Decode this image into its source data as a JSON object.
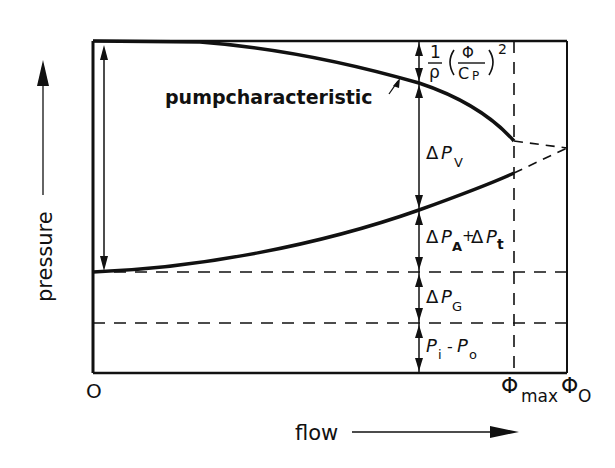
{
  "diagram": {
    "type": "pump-system-pressure-flow",
    "axes": {
      "y_label": "pressure",
      "x_label": "flow",
      "origin_label": "O",
      "x_ticks": [
        {
          "base": "Φ",
          "sub": "max"
        },
        {
          "base": "Φ",
          "sub": "O"
        }
      ]
    },
    "curve_label": "pumpcharacteristic",
    "terms": {
      "head_loss": {
        "num": "1",
        "den": "ρ",
        "frac_num": "Φ",
        "frac_den_base": "C",
        "frac_den_sub": "P",
        "exp": "2"
      },
      "delta_pv": {
        "delta": "Δ",
        "base": "P",
        "sub": "V"
      },
      "delta_pa_pt": {
        "delta1": "Δ",
        "base1": "P",
        "sub1": "A",
        "plus": "+",
        "delta2": "Δ",
        "base2": "P",
        "sub2": "t"
      },
      "delta_pg": {
        "delta": "Δ",
        "base": "P",
        "sub": "G"
      },
      "pi_po": {
        "base1": "P",
        "sub1": "i",
        "minus": "-",
        "base2": "P",
        "sub2": "o"
      }
    },
    "colors": {
      "ink": "#111111",
      "background": "#ffffff"
    }
  }
}
